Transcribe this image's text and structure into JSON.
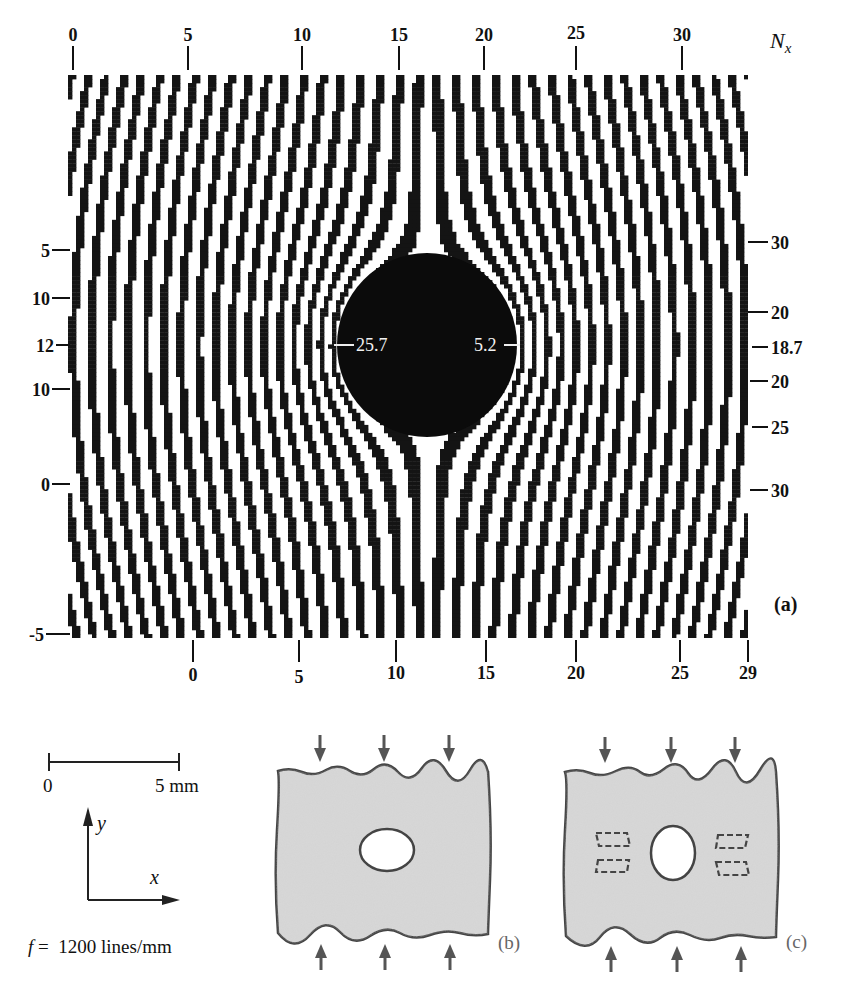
{
  "figure": {
    "panel_a": {
      "label": "(a)",
      "top_axis": {
        "name": "N",
        "subscript": "x",
        "ticks": [
          "0",
          "5",
          "10",
          "15",
          "20",
          "25",
          "30"
        ]
      },
      "bottom_axis": {
        "ticks": [
          "0",
          "5",
          "10",
          "15",
          "20",
          "25",
          "29"
        ]
      },
      "left_axis": {
        "ticks": [
          "5",
          "10",
          "12",
          "10",
          "0",
          "-5"
        ]
      },
      "right_axis": {
        "ticks": [
          "30",
          "20",
          "18.7",
          "20",
          "25",
          "30"
        ]
      },
      "hole_annotations": {
        "left": "25.7",
        "right": "5.2"
      }
    },
    "scale_bar": {
      "start": "0",
      "end": "5 mm"
    },
    "axes": {
      "y": "y",
      "x": "x"
    },
    "frequency": {
      "symbol": "f",
      "equals": "=",
      "value": "1200 lines/mm"
    },
    "panel_b": {
      "label": "(b)"
    },
    "panel_c": {
      "label": "(c)"
    }
  },
  "chart_data": {
    "type": "heatmap",
    "xlabel": "N_x",
    "ylabel": "",
    "top_axis_ticks": [
      0,
      5,
      10,
      15,
      20,
      25,
      30
    ],
    "bottom_axis_ticks": [
      0,
      5,
      10,
      15,
      20,
      25,
      29
    ],
    "left_axis_ticks": [
      5,
      10,
      12,
      10,
      0,
      -5
    ],
    "right_axis_ticks": [
      30,
      20,
      18.7,
      20,
      25,
      30
    ],
    "annotations": [
      {
        "text": "25.7",
        "position": "left edge of hole"
      },
      {
        "text": "5.2",
        "position": "right edge of hole"
      },
      {
        "text": "(a)",
        "position": "lower right"
      }
    ],
    "scale": "0 – 5 mm",
    "grating_frequency": "f = 1200 lines/mm"
  }
}
